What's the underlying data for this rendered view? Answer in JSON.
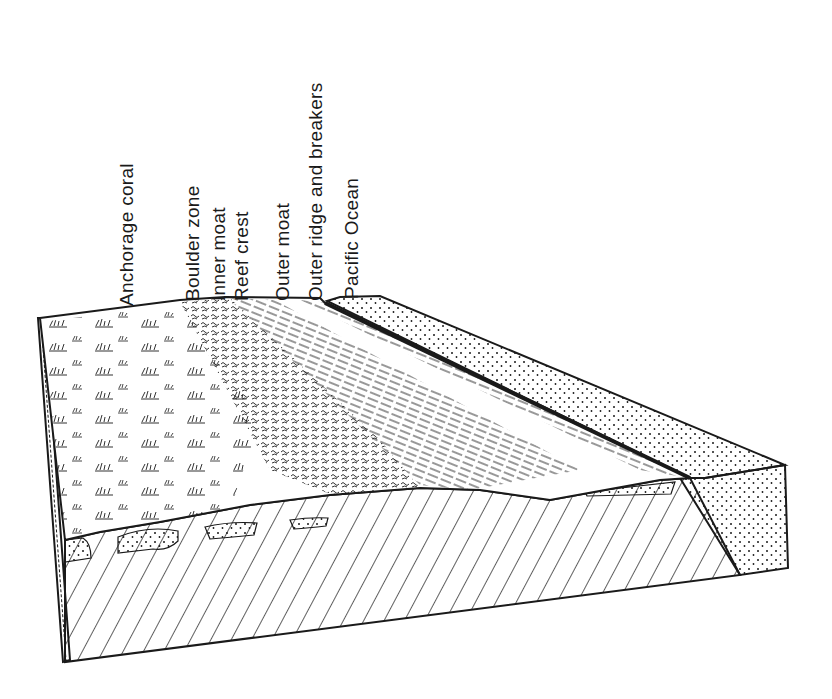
{
  "diagram": {
    "type": "block-diagram",
    "labels": [
      {
        "text": "Anchorage coral",
        "x": 117,
        "y": 306
      },
      {
        "text": "Boulder zone",
        "x": 183,
        "y": 301
      },
      {
        "text": "Inner moat",
        "x": 209,
        "y": 301
      },
      {
        "text": "Reef crest",
        "x": 232,
        "y": 301
      },
      {
        "text": "Outer moat",
        "x": 273,
        "y": 301
      },
      {
        "text": "Outer ridge and breakers",
        "x": 306,
        "y": 301
      },
      {
        "text": "Pacific Ocean",
        "x": 342,
        "y": 299
      }
    ],
    "colors": {
      "ink": "#1a1a1a",
      "background": "#ffffff"
    }
  }
}
